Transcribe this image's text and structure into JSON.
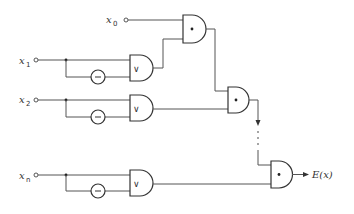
{
  "diagram": {
    "type": "logic-circuit",
    "inputs": [
      {
        "id": "x0",
        "label": "x",
        "subscript": "0"
      },
      {
        "id": "x1",
        "label": "x",
        "subscript": "1"
      },
      {
        "id": "x2",
        "label": "x",
        "subscript": "2"
      },
      {
        "id": "xn",
        "label": "x",
        "subscript": "n"
      }
    ],
    "gates": {
      "or_symbol": "∨",
      "and_symbol": "•",
      "not_symbol": "−"
    },
    "continuation": "⋮",
    "output": {
      "label": "E(x)"
    }
  }
}
